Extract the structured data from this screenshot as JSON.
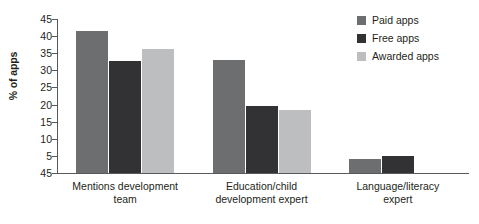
{
  "chart_data": {
    "type": "bar",
    "title": "",
    "subtitle": "",
    "xlabel": "",
    "ylabel": "% of apps",
    "ylim": [
      0,
      45
    ],
    "yticks": [
      45,
      40,
      35,
      30,
      25,
      20,
      15,
      10,
      5,
      45
    ],
    "ytick_labels": [
      "45",
      "40",
      "35",
      "30",
      "25",
      "20",
      "15",
      "10",
      "5",
      "45"
    ],
    "grid": false,
    "legend_position": "top-right",
    "categories": [
      "Mentions development team",
      "Education/child development expert",
      "Language/literacy expert"
    ],
    "category_lines": [
      [
        "Mentions development",
        "team"
      ],
      [
        "Education/child",
        "development expert"
      ],
      [
        "Language/literacy",
        "expert"
      ]
    ],
    "series": [
      {
        "name": "Paid apps",
        "color": "#6d6e70",
        "values": [
          41.5,
          33.0,
          4.0
        ]
      },
      {
        "name": "Free apps",
        "color": "#323234",
        "values": [
          32.7,
          19.7,
          5.0
        ]
      },
      {
        "name": "Awarded apps",
        "color": "#bcbec0",
        "values": [
          36.3,
          18.3,
          0.0
        ]
      }
    ]
  },
  "legend": {
    "items": [
      {
        "label": "Paid apps",
        "color": "#6d6e70"
      },
      {
        "label": "Free apps",
        "color": "#323234"
      },
      {
        "label": "Awarded apps",
        "color": "#bcbec0"
      }
    ]
  },
  "axis": {
    "y_title": "% of apps"
  }
}
